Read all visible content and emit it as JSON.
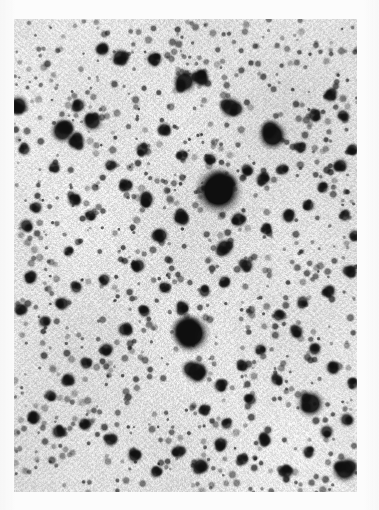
{
  "figure": {
    "kind": "astronomical-photographic-plate",
    "caption": "",
    "polarity": "negative",
    "page_background": "#fcfcfc",
    "plate": {
      "x": 14,
      "y": 19,
      "width": 343,
      "height": 473,
      "background_color": "#d6d6d6",
      "background_light": "#e8e8e8",
      "star_color": "#101010",
      "grain_strength": 0.34,
      "grain_cell": 2
    },
    "chart_data": {
      "type": "scatter",
      "title": "",
      "subtitle": "",
      "xlabel": "",
      "ylabel": "",
      "xlim": [
        0,
        343
      ],
      "ylim": [
        0,
        473
      ],
      "grid": false,
      "legend": null,
      "annotations": [],
      "series": [
        {
          "name": "stars",
          "note": "x,y in plate-local px; r = spot radius px; d = darkness 0-1",
          "points": [
            [
              204,
              171,
              13.5,
              1.0
            ],
            [
              176,
              314,
              11.0,
              0.98
            ],
            [
              258,
              116,
              8.5,
              0.95
            ],
            [
              182,
              352,
              7.0,
              0.9
            ],
            [
              296,
              384,
              8.0,
              0.92
            ],
            [
              330,
              450,
              7.5,
              0.9
            ],
            [
              48,
              112,
              7.0,
              0.88
            ],
            [
              62,
              122,
              5.5,
              0.85
            ],
            [
              78,
              102,
              6.0,
              0.86
            ],
            [
              170,
              62,
              7.0,
              0.9
            ],
            [
              186,
              58,
              5.5,
              0.84
            ],
            [
              216,
              88,
              6.5,
              0.86
            ],
            [
              224,
              200,
              5.0,
              0.82
            ],
            [
              210,
              228,
              5.5,
              0.84
            ],
            [
              140,
              40,
              5.0,
              0.8
            ],
            [
              106,
              38,
              5.5,
              0.82
            ],
            [
              88,
              30,
              4.5,
              0.78
            ],
            [
              64,
              86,
              4.5,
              0.78
            ],
            [
              4,
              86,
              6.0,
              0.86
            ],
            [
              10,
              130,
              4.0,
              0.74
            ],
            [
              40,
              148,
              4.0,
              0.74
            ],
            [
              60,
              180,
              4.5,
              0.78
            ],
            [
              22,
              188,
              4.0,
              0.74
            ],
            [
              12,
              206,
              4.5,
              0.78
            ],
            [
              76,
              196,
              4.0,
              0.74
            ],
            [
              54,
              232,
              3.5,
              0.7
            ],
            [
              16,
              258,
              4.5,
              0.78
            ],
            [
              6,
              290,
              4.5,
              0.78
            ],
            [
              30,
              302,
              4.0,
              0.74
            ],
            [
              48,
              284,
              4.5,
              0.78
            ],
            [
              62,
              268,
              4.0,
              0.72
            ],
            [
              90,
              260,
              4.0,
              0.72
            ],
            [
              124,
              246,
              4.5,
              0.78
            ],
            [
              146,
              216,
              5.0,
              0.8
            ],
            [
              166,
              198,
              5.0,
              0.8
            ],
            [
              132,
              180,
              5.0,
              0.8
            ],
            [
              112,
              166,
              4.5,
              0.76
            ],
            [
              96,
              146,
              4.0,
              0.72
            ],
            [
              128,
              130,
              4.5,
              0.76
            ],
            [
              150,
              110,
              4.5,
              0.76
            ],
            [
              168,
              136,
              4.0,
              0.72
            ],
            [
              196,
              140,
              4.0,
              0.72
            ],
            [
              232,
              150,
              4.0,
              0.72
            ],
            [
              248,
              160,
              4.5,
              0.78
            ],
            [
              268,
              150,
              4.0,
              0.72
            ],
            [
              286,
              128,
              4.0,
              0.72
            ],
            [
              300,
              96,
              4.5,
              0.76
            ],
            [
              316,
              76,
              4.5,
              0.76
            ],
            [
              328,
              96,
              4.0,
              0.72
            ],
            [
              338,
              130,
              4.0,
              0.72
            ],
            [
              326,
              146,
              4.5,
              0.76
            ],
            [
              308,
              168,
              4.0,
              0.72
            ],
            [
              294,
              186,
              4.0,
              0.72
            ],
            [
              274,
              196,
              4.5,
              0.76
            ],
            [
              252,
              210,
              4.0,
              0.72
            ],
            [
              232,
              246,
              4.5,
              0.78
            ],
            [
              210,
              262,
              4.0,
              0.72
            ],
            [
              190,
              272,
              4.0,
              0.72
            ],
            [
              168,
              288,
              4.5,
              0.76
            ],
            [
              150,
              268,
              4.0,
              0.72
            ],
            [
              130,
              292,
              4.0,
              0.72
            ],
            [
              110,
              310,
              4.5,
              0.78
            ],
            [
              92,
              330,
              4.5,
              0.78
            ],
            [
              72,
              344,
              4.0,
              0.72
            ],
            [
              54,
              360,
              4.5,
              0.78
            ],
            [
              36,
              376,
              4.0,
              0.72
            ],
            [
              20,
              398,
              4.5,
              0.78
            ],
            [
              44,
              412,
              4.5,
              0.78
            ],
            [
              70,
              404,
              4.0,
              0.72
            ],
            [
              96,
              420,
              4.5,
              0.78
            ],
            [
              120,
              436,
              4.5,
              0.78
            ],
            [
              142,
              452,
              4.0,
              0.72
            ],
            [
              164,
              432,
              4.5,
              0.78
            ],
            [
              186,
              446,
              5.0,
              0.82
            ],
            [
              206,
              424,
              4.5,
              0.78
            ],
            [
              228,
              440,
              4.0,
              0.72
            ],
            [
              250,
              420,
              4.5,
              0.78
            ],
            [
              272,
              452,
              4.5,
              0.78
            ],
            [
              294,
              432,
              4.0,
              0.72
            ],
            [
              312,
              412,
              4.5,
              0.78
            ],
            [
              332,
              400,
              4.5,
              0.78
            ],
            [
              338,
              364,
              4.0,
              0.72
            ],
            [
              318,
              348,
              4.5,
              0.78
            ],
            [
              300,
              330,
              4.0,
              0.72
            ],
            [
              282,
              312,
              4.5,
              0.76
            ],
            [
              264,
              296,
              4.0,
              0.72
            ],
            [
              246,
              330,
              4.0,
              0.72
            ],
            [
              228,
              346,
              4.0,
              0.72
            ],
            [
              206,
              366,
              4.5,
              0.76
            ],
            [
              190,
              390,
              4.0,
              0.72
            ],
            [
              212,
              404,
              4.0,
              0.72
            ],
            [
              236,
              380,
              4.0,
              0.7
            ],
            [
              262,
              360,
              4.0,
              0.7
            ],
            [
              288,
              282,
              4.0,
              0.7
            ],
            [
              314,
              272,
              4.5,
              0.76
            ],
            [
              336,
              252,
              4.5,
              0.76
            ],
            [
              340,
              216,
              4.0,
              0.7
            ],
            [
              330,
              196,
              4.0,
              0.7
            ]
          ]
        }
      ]
    }
  }
}
